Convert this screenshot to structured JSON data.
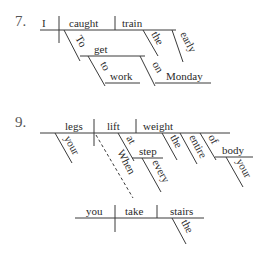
{
  "diagrams": [
    {
      "number": "7.",
      "words": {
        "subject": "I",
        "verb": "caught",
        "object": "train",
        "obj_mod_1": "the",
        "obj_mod_2": "early",
        "inf_marker": "To",
        "inf_verb": "get",
        "prep_1": "to",
        "prep_1_obj": "work",
        "prep_2": "on",
        "prep_2_obj": "Monday"
      }
    },
    {
      "number": "9.",
      "words": {
        "subject": "legs",
        "subject_mod": "your",
        "verb": "lift",
        "object": "weight",
        "obj_mod_1": "the",
        "obj_mod_2": "entire",
        "prep": "of",
        "prep_obj": "body",
        "prep_obj_mod": "your",
        "verb_prep": "at",
        "verb_prep_obj": "step",
        "verb_prep_obj_mod": "every",
        "connector": "When",
        "clause_subject": "you",
        "clause_verb": "take",
        "clause_object": "stairs",
        "clause_obj_mod": "the"
      }
    }
  ]
}
